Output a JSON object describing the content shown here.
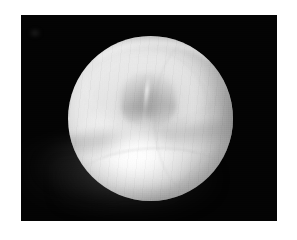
{
  "image": {
    "subject": "peeled onion bulb",
    "view": "top / stem end facing camera",
    "background_label": "black studio backdrop",
    "caption": "",
    "frame": {
      "canvas_width": 297,
      "canvas_height": 240,
      "margin_color": "#ffffff",
      "plate_color": "#030303",
      "plate_left": 21,
      "plate_top": 15,
      "plate_width": 256,
      "plate_height": 206
    },
    "subject_geometry": {
      "left": 68,
      "top": 36,
      "width": 165,
      "height": 165,
      "shape": "near-spherical, slightly flattened"
    },
    "tones": {
      "backdrop": "#030303",
      "highlight": "#ffffff",
      "body_light": "#f0f0f0",
      "body_mid": "#d2d2d2",
      "body_shadow": "#9a9a9a",
      "rim_shadow": "#6e6e6e",
      "cast_shadow": "#3c3c3c"
    },
    "features": [
      {
        "name": "recessed-top-bowl",
        "note": "concave depression across the upper half"
      },
      {
        "name": "central-neck-cluster",
        "note": "puckered stem lobes at the centre"
      },
      {
        "name": "equatorial-shoulder-groove",
        "note": "broad horizontal crease below the bowl"
      },
      {
        "name": "specular-highlight",
        "note": "bright bloom on the lower-left belly"
      },
      {
        "name": "cast-shadow",
        "note": "dim reflection spilling to the lower-left"
      },
      {
        "name": "skin-striations",
        "note": "faint papery lines following the curvature"
      }
    ]
  }
}
